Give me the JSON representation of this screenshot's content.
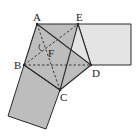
{
  "diagram": {
    "type": "geometry",
    "points": {
      "A": {
        "label": "A",
        "x": 37,
        "y": 24
      },
      "E": {
        "label": "E",
        "x": 78,
        "y": 24
      },
      "D": {
        "label": "D",
        "x": 91,
        "y": 65
      },
      "B": {
        "label": "B",
        "x": 24,
        "y": 65
      },
      "C": {
        "label": "C",
        "x": 60,
        "y": 90
      },
      "F": {
        "label": "F",
        "x": 48,
        "y": 50
      }
    },
    "angle_marks": [
      "1"
    ],
    "colors": {
      "dark_fill": "#bdbdbd",
      "light_fill": "#e4e4e4",
      "stroke": "#2a2a2a"
    }
  }
}
